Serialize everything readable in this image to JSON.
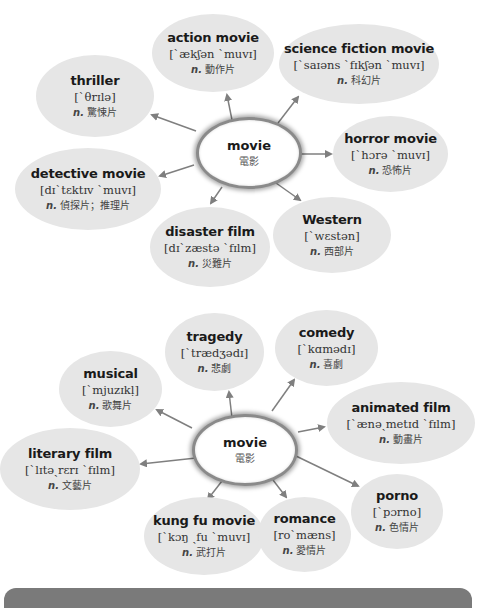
{
  "diagrams": [
    {
      "center": {
        "term": "movie",
        "zh": "電影"
      },
      "nodes": [
        {
          "term": "action movie",
          "ipa": "[ˋækʃən ˋmuvɪ]",
          "pos": "n.",
          "zh": "動作片"
        },
        {
          "term": "science fiction movie",
          "ipa": "[ˋsaɪəns ˋfɪkʃən ˋmuvɪ]",
          "pos": "n.",
          "zh": "科幻片"
        },
        {
          "term": "thriller",
          "ipa": "[ˋθrɪlə]",
          "pos": "n.",
          "zh": "驚悚片"
        },
        {
          "term": "horror movie",
          "ipa": "[ˋhɔrə ˋmuvɪ]",
          "pos": "n.",
          "zh": "恐怖片"
        },
        {
          "term": "detective movie",
          "ipa": "[dɪˋtɛktɪv ˋmuvɪ]",
          "pos": "n.",
          "zh": "偵探片；推理片"
        },
        {
          "term": "disaster film",
          "ipa": "[dɪˋzæstə ˋfɪlm]",
          "pos": "n.",
          "zh": "災難片"
        },
        {
          "term": "Western",
          "ipa": "[ˋwɛstən]",
          "pos": "n.",
          "zh": "西部片"
        }
      ]
    },
    {
      "center": {
        "term": "movie",
        "zh": "電影"
      },
      "nodes": [
        {
          "term": "tragedy",
          "ipa": "[ˋtrædʒədɪ]",
          "pos": "n.",
          "zh": "悲劇"
        },
        {
          "term": "comedy",
          "ipa": "[ˋkɑmədɪ]",
          "pos": "n.",
          "zh": "喜劇"
        },
        {
          "term": "musical",
          "ipa": "[ˋmjuzɪkḷ]",
          "pos": "n.",
          "zh": "歌舞片"
        },
        {
          "term": "animated film",
          "ipa": "[ˋænəˏmetɪd ˋfɪlm]",
          "pos": "n.",
          "zh": "動畫片"
        },
        {
          "term": "literary film",
          "ipa": "[ˋlɪtəˏrɛrɪ ˋfɪlm]",
          "pos": "n.",
          "zh": "文藝片"
        },
        {
          "term": "porno",
          "ipa": "[ˋpɔrno]",
          "pos": "n.",
          "zh": "色情片"
        },
        {
          "term": "kung fu movie",
          "ipa": "[ˋkɔŋ ˏfu ˋmuvɪ]",
          "pos": "n.",
          "zh": "武打片"
        },
        {
          "term": "romance",
          "ipa": "[roˋmæns]",
          "pos": "n.",
          "zh": "愛情片"
        }
      ]
    }
  ],
  "colors": {
    "bubble": "#e6e6e6",
    "arrow": "#7f7f7f",
    "bar": "#7a7a7a"
  }
}
